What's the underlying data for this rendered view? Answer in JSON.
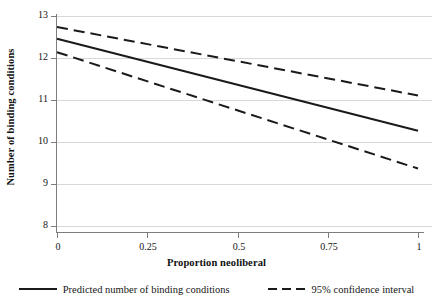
{
  "chart_data": {
    "type": "line",
    "title": "",
    "xlabel": "Proportion neoliberal",
    "ylabel": "Number of binding conditions",
    "xlim": [
      0,
      1
    ],
    "ylim": [
      8,
      13
    ],
    "grid": true,
    "grid_axis": "y",
    "legend_position": "bottom",
    "xticks": [
      0,
      0.25,
      0.5,
      0.75,
      1
    ],
    "xtick_labels": [
      "0",
      "0.25",
      "0.5",
      "0.75",
      "1"
    ],
    "yticks": [
      8,
      9,
      10,
      11,
      12,
      13
    ],
    "ytick_labels": [
      "8",
      "9",
      "10",
      "11",
      "12",
      "13"
    ],
    "x": [
      0,
      1
    ],
    "series": [
      {
        "name": "Predicted number of binding conditions",
        "style": "solid",
        "color": "#1a1a1a",
        "values": [
          12.47,
          10.28
        ]
      },
      {
        "name": "95% confidence interval upper",
        "style": "dashed",
        "color": "#1a1a1a",
        "values": [
          12.75,
          11.12
        ]
      },
      {
        "name": "95% confidence interval lower",
        "style": "dashed",
        "color": "#1a1a1a",
        "values": [
          12.15,
          9.38
        ]
      }
    ]
  },
  "axes": {
    "y_title": "Number of binding conditions",
    "x_title": "Proportion neoliberal",
    "y_ticks": [
      "13",
      "12",
      "11",
      "10",
      "9",
      "8"
    ],
    "x_ticks": [
      "0",
      "0.25",
      "0.5",
      "0.75",
      "1"
    ]
  },
  "legend": {
    "items": [
      {
        "label": "Predicted number of binding conditions",
        "style": "solid"
      },
      {
        "label": "95% confidence interval",
        "style": "dashed"
      }
    ]
  },
  "colors": {
    "line": "#1a1a1a",
    "grid": "#d8d8d8",
    "axis": "#9a9a9a",
    "background": "#ffffff"
  }
}
